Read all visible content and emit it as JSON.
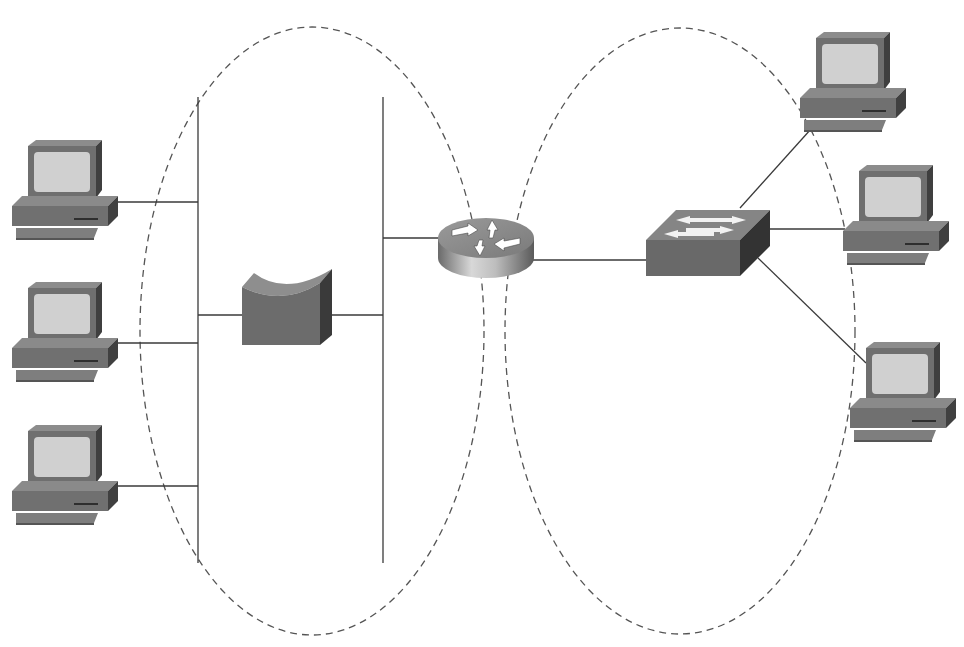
{
  "diagram": {
    "type": "network-topology",
    "colors": {
      "background": "#ffffff",
      "link": "#3a3a3a",
      "domain_outline": "#555555",
      "device_face": "#6e6e6e",
      "device_top": "#8a8a8a",
      "device_side": "#3e3e3e",
      "screen": "#cfcfcf"
    },
    "domains": [
      {
        "id": "left-domain",
        "shape": "dashed-ellipse",
        "cx": 312,
        "cy": 331,
        "rx": 172,
        "ry": 304
      },
      {
        "id": "right-domain",
        "shape": "dashed-ellipse",
        "cx": 680,
        "cy": 331,
        "rx": 175,
        "ry": 303
      }
    ],
    "devices": [
      {
        "id": "pc-left-1",
        "type": "workstation",
        "x": 12,
        "y": 140
      },
      {
        "id": "pc-left-2",
        "type": "workstation",
        "x": 12,
        "y": 282
      },
      {
        "id": "pc-left-3",
        "type": "workstation",
        "x": 12,
        "y": 425
      },
      {
        "id": "bridge",
        "type": "bridge",
        "x": 242,
        "y": 267
      },
      {
        "id": "router",
        "type": "router",
        "x": 438,
        "y": 212
      },
      {
        "id": "switch",
        "type": "switch",
        "x": 646,
        "y": 210
      },
      {
        "id": "pc-right-1",
        "type": "workstation",
        "x": 800,
        "y": 32
      },
      {
        "id": "pc-right-2",
        "type": "workstation",
        "x": 843,
        "y": 165
      },
      {
        "id": "pc-right-3",
        "type": "workstation",
        "x": 850,
        "y": 342
      }
    ],
    "segments": [
      {
        "id": "left-bus",
        "x": 198,
        "y1": 97,
        "y2": 563
      },
      {
        "id": "right-bus",
        "x": 383,
        "y1": 97,
        "y2": 563
      }
    ],
    "links": [
      {
        "from": "pc-left-1",
        "to": "left-bus"
      },
      {
        "from": "pc-left-2",
        "to": "left-bus"
      },
      {
        "from": "pc-left-3",
        "to": "left-bus"
      },
      {
        "from": "left-bus",
        "to": "bridge"
      },
      {
        "from": "bridge",
        "to": "right-bus"
      },
      {
        "from": "right-bus",
        "to": "router"
      },
      {
        "from": "router",
        "to": "switch"
      },
      {
        "from": "switch",
        "to": "pc-right-1"
      },
      {
        "from": "switch",
        "to": "pc-right-2"
      },
      {
        "from": "switch",
        "to": "pc-right-3"
      }
    ],
    "icons": {
      "workstation": "computer-icon",
      "bridge": "bridge-icon",
      "router": "router-icon",
      "switch": "switch-icon"
    }
  }
}
